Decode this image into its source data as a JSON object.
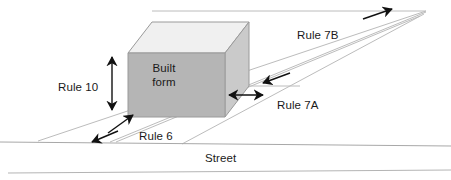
{
  "diagram": {
    "colors": {
      "box_front": "#b5b5b5",
      "box_side": "#c9c9c9",
      "box_top": "#f0f0f0",
      "box_outline": "#8a8a8a",
      "guide_line": "#b9b9b9",
      "street_line": "#a8a8a8",
      "arrow": "#111111",
      "text": "#1a1a1a"
    },
    "labels": [
      {
        "id": "rule-10",
        "text": "Rule 10",
        "x": 58,
        "y": 81
      },
      {
        "id": "rule-7b",
        "text": "Rule 7B",
        "x": 297,
        "y": 29
      },
      {
        "id": "rule-7a",
        "text": "Rule 7A",
        "x": 277,
        "y": 99
      },
      {
        "id": "rule-6",
        "text": "Rule 6",
        "x": 139,
        "y": 130
      },
      {
        "id": "street",
        "text": "Street",
        "x": 205,
        "y": 152
      }
    ],
    "built_form": {
      "line1": "Built",
      "line2": "form",
      "x": 164,
      "y": 61
    }
  }
}
